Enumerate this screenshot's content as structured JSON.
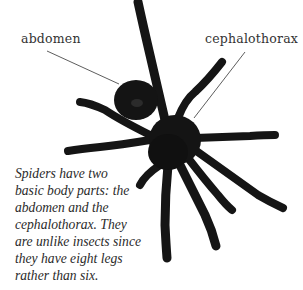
{
  "labels": {
    "abdomen": "abdomen",
    "cephalothorax": "cephalothorax"
  },
  "caption": {
    "lines": [
      "Spiders have two",
      "basic body parts: the",
      "abdomen and the",
      "cephalothorax. They",
      "are unlike insects since",
      "they have eight legs",
      "rather than six."
    ]
  },
  "illustration": {
    "subject": "spider (tarantula) photo, top-down view",
    "body_color": "#141414",
    "leader_line_color": "#333333"
  }
}
